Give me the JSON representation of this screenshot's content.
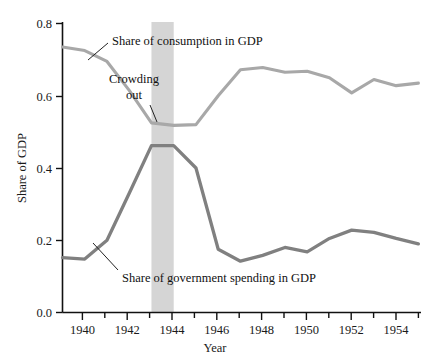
{
  "chart_data": {
    "type": "line",
    "title": "",
    "xlabel": "Year",
    "ylabel": "Share of GDP",
    "xlim": [
      1939,
      1955
    ],
    "ylim": [
      0.0,
      0.8
    ],
    "grid": false,
    "legend_position": "inline-annotations",
    "x": [
      1939,
      1940,
      1941,
      1942,
      1943,
      1944,
      1945,
      1946,
      1947,
      1948,
      1949,
      1950,
      1951,
      1952,
      1953,
      1954,
      1955
    ],
    "xticks": [
      1940,
      1942,
      1944,
      1946,
      1948,
      1950,
      1952,
      1954
    ],
    "xtick_labels": [
      "1940",
      "1942",
      "1944",
      "1946",
      "1948",
      "1950",
      "1952",
      "1954"
    ],
    "yticks": [
      0.0,
      0.2,
      0.4,
      0.6,
      0.8
    ],
    "ytick_labels": [
      "0.0",
      "0.2",
      "0.4",
      "0.6",
      "0.8"
    ],
    "series": [
      {
        "name": "Share of consumption in GDP",
        "color": "#a8a8a8",
        "values": [
          0.735,
          0.725,
          0.695,
          0.615,
          0.525,
          0.518,
          0.52,
          0.6,
          0.672,
          0.678,
          0.665,
          0.668,
          0.65,
          0.608,
          0.645,
          0.628,
          0.635
        ]
      },
      {
        "name": "Share of government spending in GDP",
        "color": "#808080",
        "values": [
          0.152,
          0.148,
          0.2,
          0.33,
          0.462,
          0.462,
          0.4,
          0.175,
          0.142,
          0.158,
          0.18,
          0.168,
          0.205,
          0.228,
          0.222,
          0.205,
          0.19
        ]
      }
    ],
    "annotations": [
      {
        "name": "crowding-out",
        "text_line1": "Crowding",
        "text_line2": "out",
        "x_span": [
          1943,
          1944
        ]
      },
      {
        "name": "consumption-label",
        "text": "Share of consumption in GDP"
      },
      {
        "name": "government-label",
        "text": "Share of government spending in GDP"
      }
    ],
    "shaded_band": {
      "label": "Crowding out",
      "start": 1943,
      "end": 1944,
      "color": "#d5d5d5"
    }
  }
}
